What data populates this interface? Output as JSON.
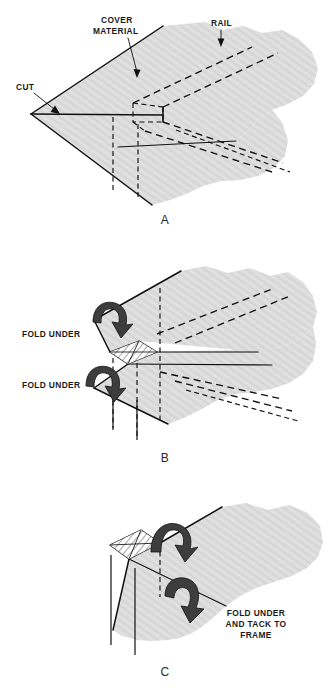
{
  "figure": {
    "background_color": "#ffffff",
    "cloth_fill_color": "#dcdcdc",
    "line_color": "#111111",
    "arrow_fill_color": "#3d3d3d",
    "panels": [
      {
        "id": "A",
        "letter": "A",
        "labels": [
          {
            "name": "cover-material",
            "text_line1": "COVER",
            "text_line2": "MATERIAL"
          },
          {
            "name": "rail",
            "text": "RAIL"
          },
          {
            "name": "cut",
            "text": "CUT"
          }
        ]
      },
      {
        "id": "B",
        "letter": "B",
        "labels": [
          {
            "name": "fold-under-top",
            "text": "FOLD UNDER"
          },
          {
            "name": "fold-under-bottom",
            "text": "FOLD UNDER"
          }
        ]
      },
      {
        "id": "C",
        "letter": "C",
        "labels": [
          {
            "name": "fold-under-and-tack",
            "text_line1": "FOLD UNDER",
            "text_line2": "AND TACK TO",
            "text_line3": "FRAME"
          }
        ]
      }
    ]
  }
}
